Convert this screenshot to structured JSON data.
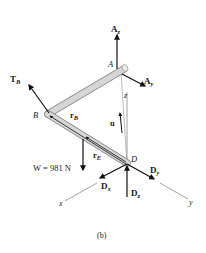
{
  "figure": {
    "caption": "(b)",
    "points": {
      "A": "A",
      "B": "B",
      "D": "D"
    },
    "axes": {
      "x": "x",
      "y": "y",
      "z": "z"
    },
    "forces": {
      "Az": {
        "main": "A",
        "sub": "z"
      },
      "Ay": {
        "main": "A",
        "sub": "y"
      },
      "TB": {
        "main": "T",
        "sub": "B"
      },
      "Dx": {
        "main": "D",
        "sub": "x"
      },
      "Dy": {
        "main": "D",
        "sub": "y"
      },
      "Dz": {
        "main": "D",
        "sub": "z"
      },
      "W": {
        "label": "W = 981 N"
      }
    },
    "vectors": {
      "u": "u",
      "rB": {
        "main": "r",
        "sub": "B"
      },
      "rE": {
        "main": "r",
        "sub": "E"
      }
    },
    "colors": {
      "rod_fill": "#d6d6d6",
      "rod_edge": "#8a8a8a",
      "arrow": "#111111",
      "axis": "#555555"
    }
  }
}
